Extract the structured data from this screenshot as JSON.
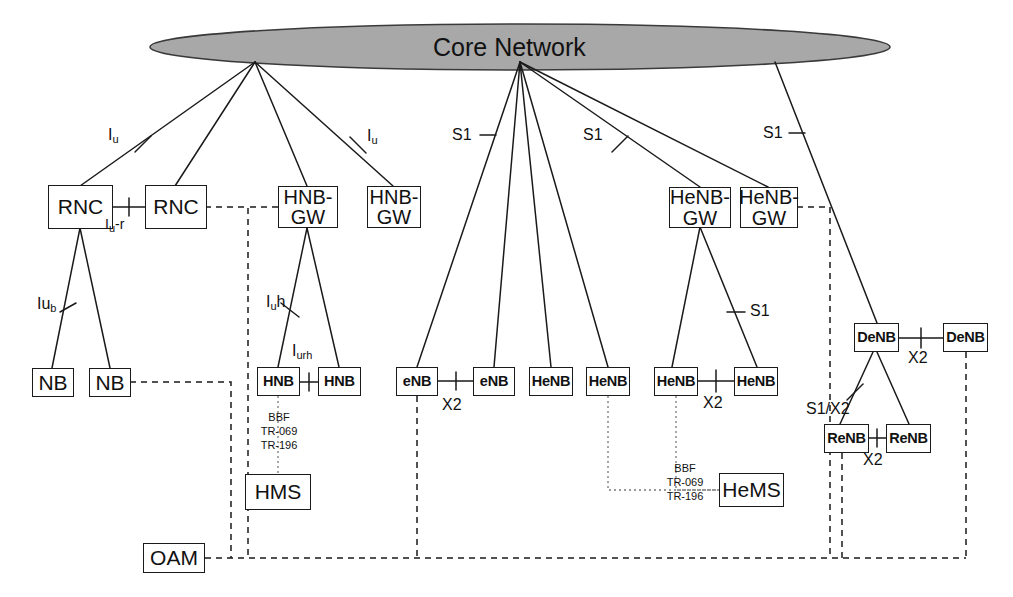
{
  "diagram": {
    "title": "Core Network",
    "cloud": {
      "label": "Core Network",
      "fill": "#a8a8a8",
      "stroke": "#333333"
    }
  },
  "nodes": [
    {
      "id": "rnc1",
      "label": "RNC",
      "style": "big"
    },
    {
      "id": "rnc2",
      "label": "RNC",
      "style": "big"
    },
    {
      "id": "hnbgw1",
      "label": "HNB-\nGW",
      "style": "big2"
    },
    {
      "id": "hnbgw2",
      "label": "HNB-\nGW",
      "style": "big2"
    },
    {
      "id": "henbgw1",
      "label": "HeNB-\nGW",
      "style": "big2"
    },
    {
      "id": "henbgw2",
      "label": "HeNB-\nGW",
      "style": "big2"
    },
    {
      "id": "nb1",
      "label": "NB",
      "style": "big"
    },
    {
      "id": "nb2",
      "label": "NB",
      "style": "big"
    },
    {
      "id": "hnb1",
      "label": "HNB",
      "style": "bold"
    },
    {
      "id": "hnb2",
      "label": "HNB",
      "style": "bold"
    },
    {
      "id": "enb1",
      "label": "eNB",
      "style": "bold"
    },
    {
      "id": "enb2",
      "label": "eNB",
      "style": "bold"
    },
    {
      "id": "henb1",
      "label": "HeNB",
      "style": "bold"
    },
    {
      "id": "henb2",
      "label": "HeNB",
      "style": "bold"
    },
    {
      "id": "henb3",
      "label": "HeNB",
      "style": "bold"
    },
    {
      "id": "henb4",
      "label": "HeNB",
      "style": "bold"
    },
    {
      "id": "denb1",
      "label": "DeNB",
      "style": "bold"
    },
    {
      "id": "denb2",
      "label": "DeNB",
      "style": "bold"
    },
    {
      "id": "renb1",
      "label": "ReNB",
      "style": "bold"
    },
    {
      "id": "renb2",
      "label": "ReNB",
      "style": "bold"
    },
    {
      "id": "hms",
      "label": "HMS",
      "style": "big"
    },
    {
      "id": "hems",
      "label": "HeMS",
      "style": "big"
    },
    {
      "id": "oam",
      "label": "OAM",
      "style": "big"
    }
  ],
  "interface_labels": {
    "iu_left": "I",
    "iu_left_sub": "u",
    "iu_right": "I",
    "iu_right_sub": "u",
    "iur": "I",
    "iur_sub": "u",
    "iur_tail": "-r",
    "iub": "Iu",
    "iub_sub": "b",
    "iuh": "I",
    "iuh_sub": "u",
    "iuh_tail": "h",
    "iurh": "I",
    "iurh_sub": "urh",
    "s1_a": "S1",
    "s1_b": "S1",
    "s1_c": "S1",
    "s1_d": "S1",
    "s1x2": "S1/X2",
    "x2_enb": "X2",
    "x2_henb": "X2",
    "x2_denb": "X2",
    "x2_renb": "X2"
  },
  "management_labels": {
    "hms_protocol": "BBF\nTR-069\nTR-196",
    "hems_protocol": "BBF\nTR-069\nTR-196"
  }
}
